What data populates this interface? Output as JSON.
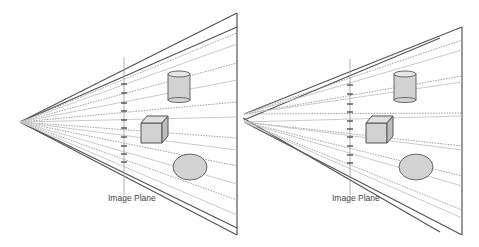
{
  "panels": [
    {
      "id": "left",
      "label": "Image Plane",
      "apex": [
        20,
        122
      ],
      "far_edge_x": 237,
      "far_edge_top": 13,
      "far_edge_bottom": 235,
      "plane_x": 124,
      "plane_top": 57,
      "plane_bottom": 195,
      "label_pos": [
        108,
        194
      ],
      "objects": [
        "cylinder",
        "cube",
        "ellipsoid"
      ]
    },
    {
      "id": "right",
      "label": "Image Plane",
      "apex": [
        244,
        114
      ],
      "apex2": [
        244,
        122
      ],
      "far_edge_x": 462,
      "far_edge_top": 27,
      "far_edge_bottom": 235,
      "plane_x": 350,
      "plane_top": 59,
      "plane_bottom": 195,
      "label_pos": [
        332,
        194
      ],
      "objects": [
        "cylinder",
        "cube",
        "ellipsoid"
      ]
    }
  ],
  "colors": {
    "frustum_edge": "#555555",
    "ray_dark": "#777777",
    "ray_light": "#c4c4c4",
    "object_fill": "#d2d2d2",
    "object_stroke": "#666666",
    "tick": "#444444"
  }
}
